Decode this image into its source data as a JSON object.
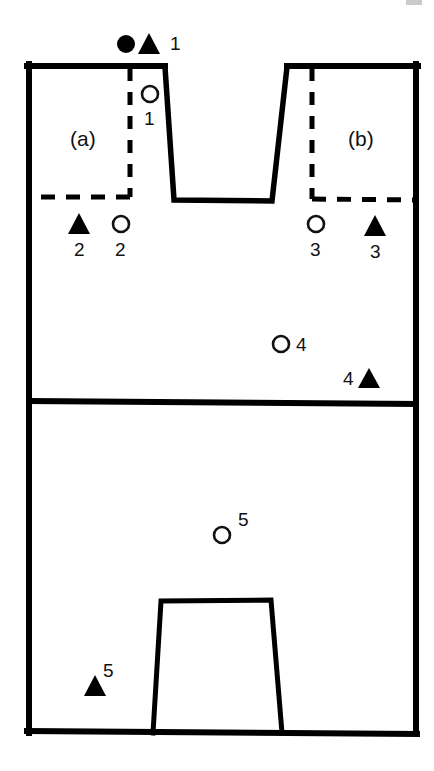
{
  "figure": {
    "panel_labels": [
      {
        "id": "panel-a",
        "text": "(a)",
        "x": 70,
        "y": 128,
        "font_size": 21
      },
      {
        "id": "panel-b",
        "text": "(b)",
        "x": 348,
        "y": 128,
        "font_size": 21
      }
    ],
    "marker_labels": [
      {
        "id": "label-top-1",
        "text": "1",
        "x": 170,
        "y": 49,
        "font_size": 19
      },
      {
        "id": "label-open-1",
        "text": "1",
        "x": 143,
        "y": 126,
        "font_size": 19
      },
      {
        "id": "label-filled-2",
        "text": "2",
        "x": 74,
        "y": 255,
        "font_size": 19
      },
      {
        "id": "label-open-2",
        "text": "2",
        "x": 115,
        "y": 255,
        "font_size": 19
      },
      {
        "id": "label-open-3",
        "text": "3",
        "x": 310,
        "y": 255,
        "font_size": 19
      },
      {
        "id": "label-filled-3",
        "text": "3",
        "x": 370,
        "y": 257,
        "font_size": 19
      },
      {
        "id": "label-open-4",
        "text": "4",
        "x": 296,
        "y": 351,
        "font_size": 19
      },
      {
        "id": "label-filled-4",
        "text": "4",
        "x": 343,
        "y": 385,
        "font_size": 19
      },
      {
        "id": "label-open-5",
        "text": "5",
        "x": 238,
        "y": 524,
        "font_size": 19
      },
      {
        "id": "label-filled-5",
        "text": "5",
        "x": 102,
        "y": 659,
        "font_size": 19
      }
    ],
    "colors": {
      "stroke": "#000000",
      "fill_marker": "#000000",
      "open_marker_stroke": "#111111",
      "background": "#ffffff",
      "text": "#111111"
    },
    "geometry": {
      "outer_box": {
        "x1": 27,
        "y1": 64,
        "x2": 418,
        "y2": 733
      },
      "mid_divider_y": 402,
      "upper_trapezoid": {
        "top_left_x": 164,
        "top_right_x": 288,
        "bottom_left_x": 173,
        "bottom_right_x": 272,
        "top_y": 66,
        "bottom_y": 200
      },
      "lower_trapezoid": {
        "top_left_x": 161,
        "top_right_x": 272,
        "bottom_left_x": 153,
        "bottom_right_x": 281,
        "top_y": 600,
        "bottom_y": 733
      },
      "dashed_left_vertical_x": 128,
      "dashed_right_vertical_x": 312,
      "dashed_step_y": 197
    },
    "markers": {
      "filled_circles": [
        {
          "id": "filled-circle-1",
          "x": 126,
          "y": 44,
          "r": 9
        }
      ],
      "filled_triangles": [
        {
          "id": "filled-triangle-1",
          "x": 149,
          "y": 44,
          "size": 11
        },
        {
          "id": "filled-triangle-2",
          "x": 79,
          "y": 224,
          "size": 11
        },
        {
          "id": "filled-triangle-3",
          "x": 375,
          "y": 226,
          "size": 11
        },
        {
          "id": "filled-triangle-4",
          "x": 369,
          "y": 378,
          "size": 11
        },
        {
          "id": "filled-triangle-5",
          "x": 95,
          "y": 686,
          "size": 11
        }
      ],
      "open_circles": [
        {
          "id": "open-circle-1",
          "x": 150,
          "y": 94,
          "r": 8
        },
        {
          "id": "open-circle-2",
          "x": 121,
          "y": 224,
          "r": 8
        },
        {
          "id": "open-circle-3",
          "x": 316,
          "y": 224,
          "r": 8
        },
        {
          "id": "open-circle-4",
          "x": 281,
          "y": 344,
          "r": 8
        },
        {
          "id": "open-circle-5",
          "x": 222,
          "y": 535,
          "r": 8
        }
      ]
    }
  }
}
